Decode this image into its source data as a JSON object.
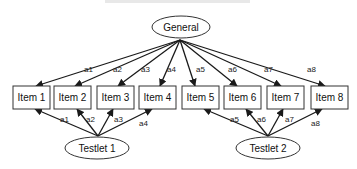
{
  "diagram": {
    "type": "bifactor-testlet-model",
    "general_factor": {
      "label": "General",
      "cx": 181,
      "cy": 27,
      "rx": 29,
      "ry": 11,
      "anchor": [
        180,
        40
      ]
    },
    "testlets": [
      {
        "label": "Testlet 1",
        "cx": 97,
        "cy": 148,
        "rx": 32,
        "ry": 11,
        "anchor": [
          98,
          136
        ]
      },
      {
        "label": "Testlet 2",
        "cx": 268,
        "cy": 148,
        "rx": 32,
        "ry": 11,
        "anchor": [
          268,
          136
        ]
      }
    ],
    "items": [
      {
        "label": "Item 1",
        "x": 13,
        "y": 86,
        "w": 37,
        "h": 23
      },
      {
        "label": "Item 2",
        "x": 54,
        "y": 86,
        "w": 37,
        "h": 23
      },
      {
        "label": "Item 3",
        "x": 97,
        "y": 86,
        "w": 37,
        "h": 23
      },
      {
        "label": "Item 4",
        "x": 139,
        "y": 86,
        "w": 37,
        "h": 23
      },
      {
        "label": "Item 5",
        "x": 182,
        "y": 86,
        "w": 37,
        "h": 23
      },
      {
        "label": "Item 6",
        "x": 224,
        "y": 86,
        "w": 37,
        "h": 23
      },
      {
        "label": "Item 7",
        "x": 267,
        "y": 86,
        "w": 37,
        "h": 23
      },
      {
        "label": "Item 8",
        "x": 311,
        "y": 86,
        "w": 37,
        "h": 23
      }
    ],
    "general_loadings": [
      {
        "label": "a1",
        "to": [
          36,
          86
        ],
        "lx": 84,
        "ly": 72
      },
      {
        "label": "a2",
        "to": [
          75,
          86
        ],
        "lx": 113,
        "ly": 72
      },
      {
        "label": "a3",
        "to": [
          118,
          86
        ],
        "lx": 141,
        "ly": 72
      },
      {
        "label": "a4",
        "to": [
          160,
          86
        ],
        "lx": 167,
        "ly": 72
      },
      {
        "label": "a5",
        "to": [
          195,
          86
        ],
        "lx": 196,
        "ly": 72
      },
      {
        "label": "a6",
        "to": [
          237,
          86
        ],
        "lx": 228,
        "ly": 72
      },
      {
        "label": "a7",
        "to": [
          281,
          86
        ],
        "lx": 264,
        "ly": 72
      },
      {
        "label": "a8",
        "to": [
          325,
          86
        ],
        "lx": 307,
        "ly": 72
      }
    ],
    "testlet_loadings": [
      {
        "testlet": 0,
        "label": "a1",
        "to": [
          35,
          109
        ],
        "lx": 60,
        "ly": 122
      },
      {
        "testlet": 0,
        "label": "a2",
        "to": [
          77,
          109
        ],
        "lx": 86,
        "ly": 122
      },
      {
        "testlet": 0,
        "label": "a3",
        "to": [
          113,
          109
        ],
        "lx": 114,
        "ly": 122
      },
      {
        "testlet": 0,
        "label": "a4",
        "to": [
          152,
          109
        ],
        "lx": 139,
        "ly": 126
      },
      {
        "testlet": 1,
        "label": "a5",
        "to": [
          204,
          109
        ],
        "lx": 230,
        "ly": 122
      },
      {
        "testlet": 1,
        "label": "a6",
        "to": [
          246,
          109
        ],
        "lx": 257,
        "ly": 122
      },
      {
        "testlet": 1,
        "label": "a7",
        "to": [
          283,
          109
        ],
        "lx": 285,
        "ly": 122
      },
      {
        "testlet": 1,
        "label": "a8",
        "to": [
          322,
          109
        ],
        "lx": 311,
        "ly": 126
      }
    ]
  }
}
